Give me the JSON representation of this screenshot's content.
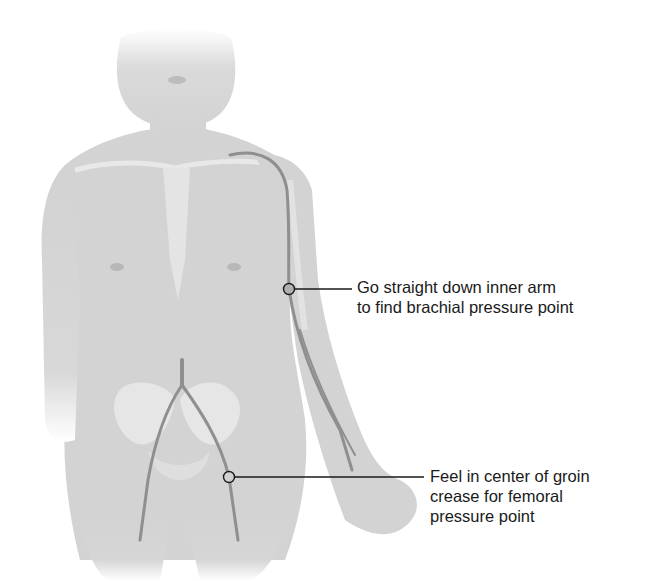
{
  "figure": {
    "colors": {
      "background": "#ffffff",
      "skin": "#d4d4d4",
      "skin_shadow": "#bdbdbd",
      "bone": "#e6e6e6",
      "artery": "#8f8f8f",
      "leader_line": "#1a1a1a",
      "label_text": "#1a1a1a"
    },
    "callouts": [
      {
        "id": "brachial",
        "marker": {
          "x": 289,
          "y": 289
        },
        "lines": [
          "Go straight down inner arm",
          "to find brachial pressure point"
        ]
      },
      {
        "id": "femoral",
        "marker": {
          "x": 229,
          "y": 477
        },
        "lines": [
          "Feel in center of groin",
          "crease for femoral",
          "pressure point"
        ]
      }
    ]
  }
}
